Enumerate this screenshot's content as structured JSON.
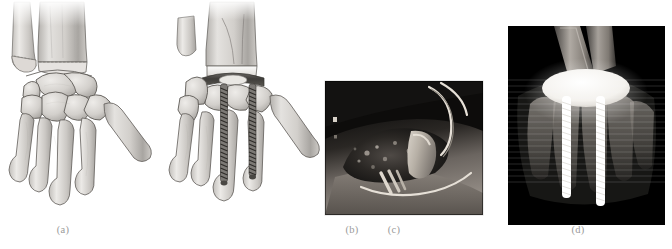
{
  "figure": {
    "type": "multi-panel medical figure",
    "panel_count": 4,
    "background_color": "#ffffff",
    "label_color": "#9a9a9a"
  },
  "panels": [
    {
      "id": "a",
      "label": "(a)",
      "label_x": 63,
      "label_y": 230,
      "kind": "anatomical-illustration",
      "description": "Grayscale pencil-shaded illustration of a native wrist: distal radius and ulna, proximal and distal carpal rows, five metacarpals",
      "palette": {
        "bone_light": "#e9e8e6",
        "bone_mid": "#c9c7c4",
        "bone_shadow": "#9b9894",
        "outline": "#5e5b57"
      }
    },
    {
      "id": "b",
      "label": "(b)",
      "label_x": 186,
      "label_y": 230,
      "kind": "anatomical-illustration",
      "description": "Same wrist after total wrist arthroplasty: resected distal ulna fragment, radial component seated in radius, carpal plate with two long threaded screws descending into the second and third metacarpals",
      "palette": {
        "bone_light": "#e9e8e6",
        "bone_mid": "#c9c7c4",
        "bone_shadow": "#9b9894",
        "outline": "#5e5b57",
        "implant_bright": "#f6f6f4",
        "implant_dark": "#4d4b48",
        "screw": "#3f3d3a"
      }
    },
    {
      "id": "c",
      "label": "(c)",
      "label_x": 394,
      "label_y": 230,
      "kind": "intraoperative-photograph",
      "description": "Black-and-white intraoperative photo of a dorsal wrist approach; skin flaps retracted, implant body visible in the exposed joint with sutures and a retractor loop",
      "palette": {
        "darkest": "#0a0a0a",
        "tissue_dark": "#3a3734",
        "tissue_mid": "#8d8782",
        "highlight": "#e2ddd6"
      }
    },
    {
      "id": "d",
      "label": "(d)",
      "label_x": 578,
      "label_y": 230,
      "kind": "radiograph",
      "description": "Postoperative anteroposterior radiograph of the wrist showing the radiopaque elliptical implant plate and two long threaded intramedullary screws in the metacarpals",
      "palette": {
        "background": "#000000",
        "bone_faint": "#6e6a66",
        "bone_bright": "#cfcac4",
        "metal": "#ffffff"
      }
    }
  ]
}
